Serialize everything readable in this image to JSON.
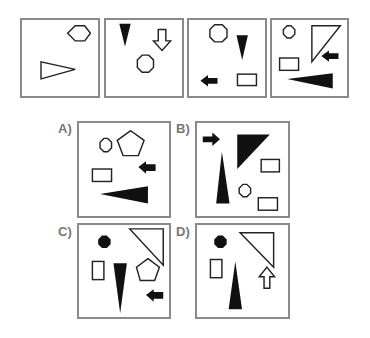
{
  "sequence": {
    "panels": [
      {
        "index": 1,
        "shapes": [
          "hexagon-outline",
          "triangle-outline-right"
        ]
      },
      {
        "index": 2,
        "shapes": [
          "triangle-filled-down",
          "arrow-outline-down",
          "cross-octagon-outline"
        ]
      },
      {
        "index": 3,
        "shapes": [
          "cross-octagon-outline",
          "triangle-filled-down",
          "arrow-filled-left",
          "rectangle-outline"
        ]
      },
      {
        "index": 4,
        "shapes": [
          "cross-small-outline",
          "right-triangle-outline",
          "arrow-filled-left",
          "rectangle-outline",
          "wedge-filled-left"
        ]
      }
    ]
  },
  "options": [
    {
      "label": "A)",
      "shapes": [
        "cross-small-outline",
        "pentagon-outline",
        "arrow-filled-left",
        "rectangle-outline",
        "wedge-filled-left"
      ]
    },
    {
      "label": "B)",
      "shapes": [
        "arrow-filled-right",
        "right-triangle-filled",
        "triangle-filled-up",
        "rectangle-outline",
        "cross-small-outline",
        "rectangle-outline"
      ]
    },
    {
      "label": "C)",
      "shapes": [
        "cross-filled",
        "right-triangle-outline",
        "rectangle-outline-vertical",
        "triangle-filled-down",
        "pentagon-outline",
        "arrow-filled-left"
      ]
    },
    {
      "label": "D)",
      "shapes": [
        "cross-filled",
        "right-triangle-outline",
        "rectangle-outline-vertical",
        "triangle-filled-up",
        "arrow-outline-up"
      ]
    }
  ]
}
